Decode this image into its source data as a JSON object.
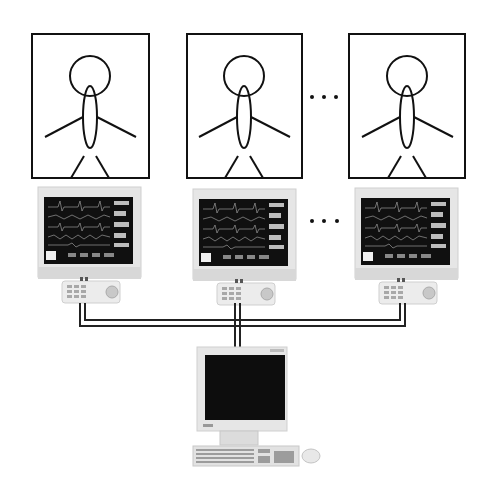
{
  "diagram": {
    "type": "patient-monitoring-network",
    "patients": [
      {
        "id": 1,
        "box": {
          "x": 32,
          "y": 34,
          "w": 117,
          "h": 144
        }
      },
      {
        "id": 2,
        "box": {
          "x": 187,
          "y": 34,
          "w": 115,
          "h": 144
        }
      },
      {
        "id": 3,
        "box": {
          "x": 349,
          "y": 34,
          "w": 116,
          "h": 144
        }
      }
    ],
    "bedside_monitors": [
      {
        "id": 1,
        "x": 38,
        "y": 187
      },
      {
        "id": 2,
        "x": 193,
        "y": 189
      },
      {
        "id": 3,
        "x": 355,
        "y": 188
      }
    ],
    "ellipsis_patients": "...",
    "ellipsis_monitors": "...",
    "central_station": {
      "label": "central-workstation"
    },
    "colors": {
      "line": "#111111",
      "bezel": "#e4e4e4",
      "screen": "#0d0d0d",
      "keypad": "#ececec"
    }
  }
}
